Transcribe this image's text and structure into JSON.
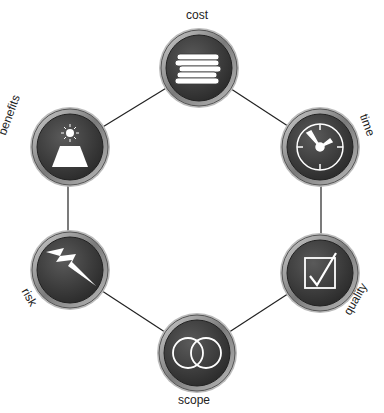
{
  "diagram": {
    "type": "cycle",
    "nodes": [
      {
        "id": "cost",
        "label": "cost",
        "icon": "coin-stack-icon"
      },
      {
        "id": "time",
        "label": "time",
        "icon": "clock-icon"
      },
      {
        "id": "quality",
        "label": "quality",
        "icon": "checkbox-icon"
      },
      {
        "id": "scope",
        "label": "scope",
        "icon": "overlapping-circles-icon"
      },
      {
        "id": "risk",
        "label": "risk",
        "icon": "lightning-bolt-icon"
      },
      {
        "id": "benefits",
        "label": "benefits",
        "icon": "mountain-sun-icon"
      }
    ],
    "edges": [
      [
        "cost",
        "time"
      ],
      [
        "time",
        "quality"
      ],
      [
        "quality",
        "scope"
      ],
      [
        "scope",
        "risk"
      ],
      [
        "risk",
        "benefits"
      ],
      [
        "benefits",
        "cost"
      ]
    ],
    "colors": {
      "node_fill": "#3a3a3a",
      "node_rim": "#9a9a9a",
      "icon": "#ffffff",
      "edge": "#222222"
    }
  }
}
